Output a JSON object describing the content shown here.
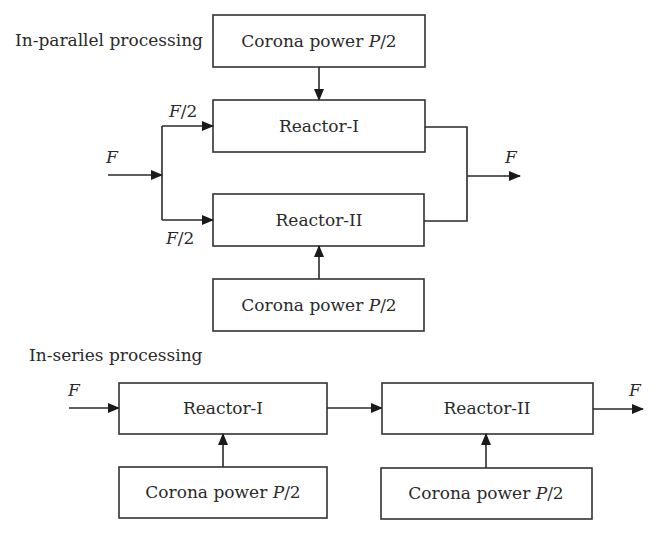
{
  "parallel": {
    "title": "In-parallel processing",
    "corona_top": {
      "text": "Corona power ",
      "var": "P",
      "suffix": "/2"
    },
    "reactor_1": "Reactor-I",
    "reactor_2": "Reactor-II",
    "corona_bottom": {
      "text": "Corona power ",
      "var": "P",
      "suffix": "/2"
    },
    "input_label": "F",
    "branch_top_label": {
      "var": "F",
      "suffix": "/2"
    },
    "branch_bottom_label": {
      "var": "F",
      "suffix": "/2"
    },
    "output_label": "F"
  },
  "series": {
    "title": "In-series processing",
    "reactor_1": "Reactor-I",
    "reactor_2": "Reactor-II",
    "corona_1": {
      "text": "Corona power ",
      "var": "P",
      "suffix": "/2"
    },
    "corona_2": {
      "text": "Corona power ",
      "var": "P",
      "suffix": "/2"
    },
    "input_label": "F",
    "output_label": "F"
  },
  "colors": {
    "line": "#2a2a2a",
    "background": "#ffffff"
  }
}
